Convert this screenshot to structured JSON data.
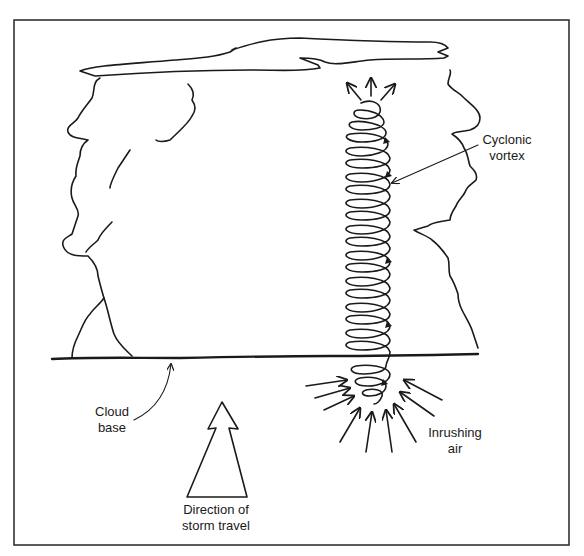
{
  "figure": {
    "labels": {
      "vortex_line1": "Cyclonic",
      "vortex_line2": "vortex",
      "cloud_base_line1": "Cloud",
      "cloud_base_line2": "base",
      "inrushing_line1": "Inrushing",
      "inrushing_line2": "air",
      "direction_line1": "Direction of",
      "direction_line2": "storm travel"
    },
    "elements": {
      "anvil": "anvil-top",
      "cloud_body": "cumulonimbus-cloud",
      "vortex": "spiral-vortex",
      "outflow_arrows": 3,
      "inflow_arrows": 10,
      "direction_arrow": "hollow-up-arrow"
    },
    "colors": {
      "ink": "#1a1a1a",
      "frame": "#333333",
      "background": "#ffffff"
    }
  }
}
